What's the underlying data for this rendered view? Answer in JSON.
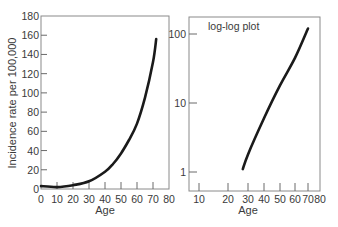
{
  "chart_data": [
    {
      "type": "line",
      "title": "",
      "xlabel": "Age",
      "ylabel": "Incidence rate per 100,000",
      "xlim": [
        0,
        80
      ],
      "ylim": [
        0,
        180
      ],
      "x_scale": "linear",
      "y_scale": "linear",
      "grid": false,
      "x_ticks": [
        0,
        10,
        20,
        30,
        40,
        50,
        60,
        70,
        80
      ],
      "y_ticks": [
        0,
        20,
        40,
        60,
        80,
        100,
        120,
        140,
        160,
        180
      ],
      "series": [
        {
          "name": "Incidence",
          "x": [
            0,
            10,
            20,
            30,
            40,
            45,
            50,
            55,
            60,
            65,
            70,
            72
          ],
          "y": [
            3,
            2,
            4,
            8,
            18,
            26,
            37,
            51,
            68,
            95,
            132,
            156
          ]
        }
      ]
    },
    {
      "type": "line",
      "title": "log-log plot",
      "xlabel": "Age",
      "ylabel": "",
      "xlim": [
        10,
        80
      ],
      "ylim": [
        0.8,
        130
      ],
      "x_scale": "log",
      "y_scale": "log",
      "grid": false,
      "x_ticks": [
        10,
        20,
        30,
        40,
        50,
        60,
        70,
        80
      ],
      "y_ticks": [
        1,
        10,
        100
      ],
      "annotations": [
        "log-log plot"
      ],
      "series": [
        {
          "name": "Incidence (log-log)",
          "x": [
            27,
            30,
            40,
            50,
            60,
            70
          ],
          "y": [
            1.1,
            1.8,
            6,
            18,
            45,
            120
          ]
        }
      ]
    }
  ],
  "left_panel": {
    "ylabel": "Incidence rate per 100,000",
    "xlabel": "Age",
    "y_tick_labels": [
      "0",
      "20",
      "40",
      "60",
      "80",
      "100",
      "120",
      "140",
      "160",
      "180"
    ],
    "x_tick_labels": [
      "0",
      "10",
      "20",
      "30",
      "40",
      "50",
      "60",
      "70",
      "80"
    ]
  },
  "right_panel": {
    "annotation": "log-log plot",
    "xlabel": "Age",
    "y_tick_labels": [
      "1",
      "10",
      "100"
    ],
    "x_tick_labels": [
      "10",
      "20",
      "30",
      "40",
      "50",
      "60",
      "70",
      "80"
    ]
  }
}
